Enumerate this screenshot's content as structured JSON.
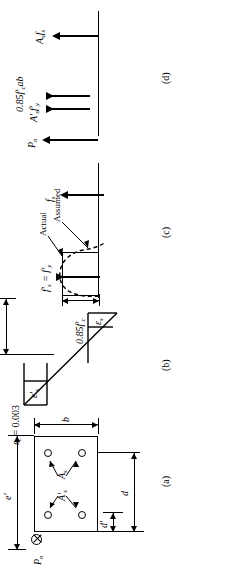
{
  "figure": {
    "panels": [
      {
        "id": "a",
        "label": "(a)",
        "name": "cross-section"
      },
      {
        "id": "b",
        "label": "(b)",
        "name": "strain-diagram"
      },
      {
        "id": "c",
        "label": "(c)",
        "name": "stress-diagram"
      },
      {
        "id": "d",
        "label": "(d)",
        "name": "force-diagram"
      }
    ]
  },
  "panel_a": {
    "label": "(a)",
    "load_symbol": "P",
    "load_sub": "n",
    "dim_b": "b",
    "dim_d_prime": "d′",
    "dim_d": "d",
    "dim_e_prime": "e′",
    "steel_top": "A′",
    "steel_top_sub": "s",
    "steel_bottom": "A",
    "steel_bottom_sub": "s"
  },
  "panel_b": {
    "label": "(b)",
    "strain_concrete": "ε",
    "strain_concrete_sub": "c",
    "strain_concrete_value": " = 0.003",
    "strain_comp_steel": "ε′",
    "strain_comp_steel_sub": "s",
    "strain_tens_steel": "ε",
    "strain_tens_steel_sub": "s",
    "dim_c": "c",
    "dim_a": "a"
  },
  "panel_c": {
    "label": "(c)",
    "stress_block": "0.85f′",
    "stress_block_sub": "c",
    "comp_steel_stress": "f′",
    "comp_steel_stress_sub": "s",
    "comp_steel_stress_eq": " = f′",
    "comp_steel_stress_eq_sub": "y",
    "tens_steel_stress": "f",
    "tens_steel_stress_sub": "s",
    "curve_actual": "Actual",
    "curve_assumed": "Assumed"
  },
  "panel_d": {
    "label": "(d)",
    "force_pn": "P",
    "force_pn_sub": "n",
    "force_comp_steel": "A′",
    "force_comp_steel_sub1": "s",
    "force_comp_steel_2": "f′",
    "force_comp_steel_sub2": "y",
    "force_concrete": "0.85f′",
    "force_concrete_sub": "c",
    "force_concrete_tail": "ab",
    "force_tens_steel": "A",
    "force_tens_steel_sub1": "s",
    "force_tens_steel_2": "f",
    "force_tens_steel_sub2": "s"
  },
  "colors": {
    "ink": "#000000",
    "paper": "#ffffff"
  }
}
